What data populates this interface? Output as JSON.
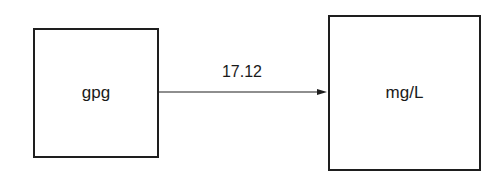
{
  "diagram": {
    "nodes": [
      {
        "id": "gpg",
        "label": "gpg"
      },
      {
        "id": "mgL",
        "label": "mg/L"
      }
    ],
    "edges": [
      {
        "from": "gpg",
        "to": "mgL",
        "label": "17.12"
      }
    ]
  }
}
